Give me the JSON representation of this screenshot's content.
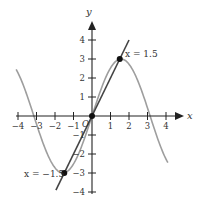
{
  "chart_data": {
    "type": "line",
    "title": "",
    "xlabel": "x",
    "ylabel": "y",
    "origin_label": "O",
    "xlim": [
      -4.2,
      4.7
    ],
    "ylim": [
      -4.2,
      4.9
    ],
    "x_ticks": [
      -4,
      -3,
      -2,
      -1,
      1,
      2,
      3,
      4
    ],
    "y_ticks": [
      -4,
      -3,
      -2,
      -1,
      1,
      2,
      3,
      4
    ],
    "grid": false,
    "series": [
      {
        "name": "curve",
        "function": "y = 3 sin(x)",
        "color": "#9e9e9e",
        "x_range": [
          -4.1,
          4.1
        ],
        "points": [
          [
            -4,
            2.27
          ],
          [
            -3.14,
            0
          ],
          [
            -1.57,
            -3
          ],
          [
            0,
            0
          ],
          [
            1.57,
            3
          ],
          [
            3.14,
            0
          ],
          [
            4,
            -2.27
          ]
        ]
      },
      {
        "name": "line",
        "function": "y = 2x",
        "color": "#444444",
        "x_range": [
          -1.95,
          2.0
        ],
        "points": [
          [
            -1.95,
            -3.9
          ],
          [
            0,
            0
          ],
          [
            2.0,
            4.0
          ]
        ]
      }
    ],
    "points": [
      {
        "x": 0,
        "y": 0,
        "label": ""
      },
      {
        "x": 1.5,
        "y": 3,
        "label": "x = 1.5"
      },
      {
        "x": -1.5,
        "y": -3,
        "label": "x = −1.5"
      }
    ]
  },
  "labels": {
    "x_axis": "x",
    "y_axis": "y",
    "origin": "O",
    "point_pos": "x = 1.5",
    "point_neg": "x = −1.5",
    "xticks": [
      "−4",
      "−3",
      "−2",
      "−1",
      "1",
      "2",
      "3",
      "4"
    ],
    "yticks_pos": [
      "4",
      "3",
      "2",
      "1"
    ],
    "yticks_neg": [
      "−1",
      "−2",
      "−3",
      "−4"
    ]
  }
}
